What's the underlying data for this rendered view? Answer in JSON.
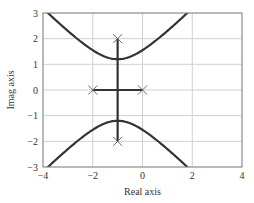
{
  "chart_data": {
    "type": "line",
    "title": "",
    "xlabel": "Real axis",
    "ylabel": "Imag axis",
    "xlim": [
      -4,
      4
    ],
    "ylim": [
      -3,
      3
    ],
    "xticks": [
      -4,
      -2,
      0,
      2,
      4
    ],
    "yticks": [
      -3,
      -2,
      -1,
      0,
      1,
      2,
      3
    ],
    "xtick_labels": [
      "−4",
      "−2",
      "0",
      "2",
      "4"
    ],
    "ytick_labels": [
      "−3",
      "−2",
      "−1",
      "0",
      "1",
      "2",
      "3"
    ],
    "grid": true,
    "legend": null,
    "series": [
      {
        "name": "upper-branch",
        "description": "hyperbola-like root locus branch, vertex near (-1, 1.2)",
        "x": [
          -3.85,
          -3.5,
          -3.0,
          -2.5,
          -2.0,
          -1.5,
          -1.0,
          -0.5,
          0.0,
          0.5,
          1.0,
          1.5,
          1.8
        ],
        "y": [
          3.0,
          2.72,
          2.29,
          1.88,
          1.55,
          1.3,
          1.2,
          1.3,
          1.55,
          1.88,
          2.29,
          2.72,
          3.0
        ]
      },
      {
        "name": "lower-branch",
        "description": "mirror of upper branch across real axis",
        "x": [
          -3.85,
          -3.5,
          -3.0,
          -2.5,
          -2.0,
          -1.5,
          -1.0,
          -0.5,
          0.0,
          0.5,
          1.0,
          1.5,
          1.8
        ],
        "y": [
          -3.0,
          -2.72,
          -2.29,
          -1.88,
          -1.55,
          -1.3,
          -1.2,
          -1.3,
          -1.55,
          -1.88,
          -2.29,
          -2.72,
          -3.0
        ]
      },
      {
        "name": "real-axis-segment",
        "x": [
          -2,
          0
        ],
        "y": [
          0,
          0
        ]
      },
      {
        "name": "vertical-segment",
        "x": [
          -1,
          -1
        ],
        "y": [
          -2,
          2
        ]
      }
    ],
    "markers": {
      "symbol": "x",
      "points": [
        {
          "x": -1,
          "y": 2
        },
        {
          "x": -1,
          "y": -2
        },
        {
          "x": -2,
          "y": 0
        },
        {
          "x": 0,
          "y": 0
        }
      ]
    },
    "colors": {
      "curve": "#333333",
      "grid": "#d0d0d0",
      "axes": "#8a8a8a",
      "marker": "#666666"
    }
  }
}
